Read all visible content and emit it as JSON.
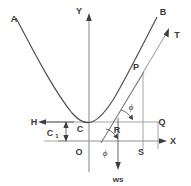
{
  "figure": {
    "type": "geometry-diagram",
    "width": 191,
    "height": 186,
    "background_color": "#ffffff",
    "line_color": "#4a4a4a",
    "axis_color": "#8f8f8f",
    "label_color": "#3a3a3a"
  },
  "labels": {
    "curve_left_end": "A",
    "curve_right_end": "B",
    "tangent_end": "T",
    "point_on_curve": "P",
    "lowest_point": "C",
    "origin": "O",
    "point_r": "R",
    "point_q": "Q",
    "point_s": "S",
    "axis_x": "X",
    "axis_y": "Y",
    "horizontal_force": "H",
    "vertical_load": "ws",
    "dimension_c1": "C",
    "dimension_c1_sub": "1",
    "angle_upper": "ϕ",
    "angle_lower": "ϕ"
  },
  "geometry": {
    "origin_px": {
      "x": 89,
      "y": 141
    },
    "lowest_point_px": {
      "x": 89,
      "y": 122
    },
    "point_p_px": {
      "x": 143,
      "y": 73
    },
    "point_r_px": {
      "x": 118,
      "y": 122
    },
    "point_q_px": {
      "x": 158,
      "y": 122
    },
    "point_s_px": {
      "x": 143,
      "y": 141
    },
    "c1_top_y": 122,
    "c1_bottom_y": 141,
    "x_axis_y": 141,
    "y_axis_x": 89,
    "horizontal_ref_line_y": 122
  }
}
